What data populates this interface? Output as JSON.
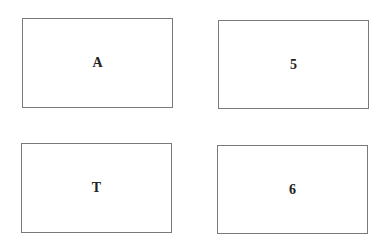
{
  "cards": [
    {
      "label": "A"
    },
    {
      "label": "5"
    },
    {
      "label": "T"
    },
    {
      "label": "6"
    }
  ],
  "colors": {
    "border": "#7a7a7a",
    "text": "#222222",
    "background": "#ffffff"
  }
}
